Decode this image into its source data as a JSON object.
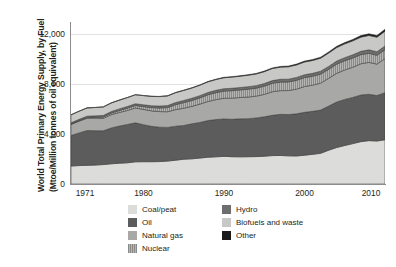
{
  "chart_data": {
    "type": "area",
    "stacked": true,
    "title": "",
    "xlabel": "",
    "ylabel": "World Total Primary Energy Supply, by Fuel (Mtoe/Million tonnes of oil equivalent)",
    "ylabel_line1": "World Total Primary Energy Supply, by Fuel",
    "ylabel_line2": "(Mtoe/Million tonnes of oil equivalent)",
    "xlim": [
      1971,
      2010
    ],
    "ylim": [
      0,
      13000
    ],
    "yticks": [
      0,
      4000,
      8000,
      12000
    ],
    "ytick_labels": [
      "0",
      "4,000",
      "8,000",
      "12,000"
    ],
    "xticks": [
      1971,
      1980,
      1990,
      2000,
      2010
    ],
    "xtick_labels": [
      "1971",
      "1980",
      "1990",
      "2000",
      "2010"
    ],
    "grid": "horizontal",
    "legend_position": "bottom",
    "x": [
      1971,
      1972,
      1973,
      1974,
      1975,
      1976,
      1977,
      1978,
      1979,
      1980,
      1981,
      1982,
      1983,
      1984,
      1985,
      1986,
      1987,
      1988,
      1989,
      1990,
      1991,
      1992,
      1993,
      1994,
      1995,
      1996,
      1997,
      1998,
      1999,
      2000,
      2001,
      2002,
      2003,
      2004,
      2005,
      2006,
      2007,
      2008,
      2009,
      2010
    ],
    "series": [
      {
        "name": "Coal/peat",
        "color": "#dcdcda",
        "values": [
          1440,
          1480,
          1500,
          1520,
          1560,
          1620,
          1670,
          1700,
          1780,
          1790,
          1790,
          1800,
          1840,
          1910,
          1990,
          2020,
          2080,
          2150,
          2180,
          2220,
          2190,
          2180,
          2190,
          2200,
          2230,
          2280,
          2290,
          2260,
          2250,
          2310,
          2380,
          2460,
          2710,
          2930,
          3090,
          3240,
          3400,
          3480,
          3450,
          3550
        ]
      },
      {
        "name": "Oil",
        "color": "#5c5c5c",
        "values": [
          2450,
          2620,
          2790,
          2760,
          2710,
          2880,
          2980,
          3080,
          3130,
          2970,
          2840,
          2760,
          2700,
          2730,
          2710,
          2810,
          2860,
          2940,
          2990,
          3000,
          3000,
          3050,
          3050,
          3100,
          3160,
          3230,
          3300,
          3310,
          3380,
          3440,
          3450,
          3470,
          3540,
          3650,
          3700,
          3710,
          3740,
          3720,
          3650,
          3780
        ]
      },
      {
        "name": "Natural gas",
        "color": "#a8a8a6",
        "values": [
          890,
          940,
          990,
          1000,
          1000,
          1060,
          1090,
          1120,
          1190,
          1230,
          1240,
          1250,
          1260,
          1330,
          1380,
          1400,
          1470,
          1530,
          1600,
          1660,
          1700,
          1710,
          1740,
          1750,
          1800,
          1890,
          1900,
          1930,
          1980,
          2070,
          2100,
          2160,
          2230,
          2300,
          2360,
          2420,
          2510,
          2560,
          2520,
          2730
        ]
      },
      {
        "name": "Nuclear",
        "color": "#9d9d9b",
        "hatch": "vertical",
        "values": [
          29,
          41,
          54,
          71,
          110,
          130,
          160,
          190,
          200,
          220,
          260,
          290,
          330,
          400,
          450,
          470,
          500,
          540,
          560,
          580,
          600,
          610,
          630,
          640,
          660,
          680,
          690,
          690,
          710,
          720,
          720,
          730,
          720,
          740,
          740,
          740,
          730,
          730,
          710,
          720
        ]
      },
      {
        "name": "Hydro",
        "color": "#6e6e6e",
        "values": [
          104,
          107,
          111,
          117,
          122,
          123,
          128,
          135,
          140,
          148,
          150,
          155,
          163,
          170,
          174,
          178,
          180,
          185,
          186,
          187,
          192,
          194,
          199,
          204,
          212,
          217,
          220,
          223,
          227,
          228,
          231,
          232,
          235,
          245,
          250,
          259,
          265,
          276,
          282,
          295
        ]
      },
      {
        "name": "Biofuels and waste",
        "color": "#c8c8c6",
        "values": [
          640,
          650,
          660,
          670,
          680,
          690,
          700,
          710,
          720,
          735,
          750,
          760,
          775,
          790,
          805,
          820,
          835,
          850,
          865,
          880,
          895,
          905,
          920,
          935,
          950,
          965,
          975,
          990,
          1005,
          1020,
          1030,
          1045,
          1070,
          1085,
          1105,
          1120,
          1140,
          1155,
          1170,
          1190
        ]
      },
      {
        "name": "Other",
        "color": "#1a1a1a",
        "values": [
          4,
          5,
          5,
          6,
          7,
          8,
          9,
          10,
          11,
          12,
          14,
          16,
          18,
          20,
          23,
          25,
          28,
          30,
          33,
          36,
          39,
          42,
          45,
          48,
          52,
          56,
          60,
          64,
          68,
          73,
          78,
          83,
          89,
          96,
          104,
          113,
          123,
          133,
          142,
          152
        ]
      }
    ],
    "totals": [
      5557,
      5843,
      6110,
      6144,
      6189,
      6511,
      6737,
      6945,
      7171,
      7105,
      7044,
      7031,
      7086,
      7350,
      7532,
      7723,
      7953,
      8225,
      8414,
      8561,
      8576,
      8691,
      8774,
      8877,
      9064,
      9316,
      9435,
      9467,
      9620,
      9861,
      9989,
      10180,
      10594,
      11031,
      11349,
      11602,
      11908,
      12054,
      11924,
      12417
    ],
    "legend": {
      "left_column": [
        {
          "label": "Coal/peat",
          "color": "#dcdcda",
          "pattern": "solid"
        },
        {
          "label": "Oil",
          "color": "#5c5c5c",
          "pattern": "solid"
        },
        {
          "label": "Natural gas",
          "color": "#a8a8a6",
          "pattern": "solid"
        },
        {
          "label": "Nuclear",
          "color": "#9d9d9b",
          "pattern": "vertical-hatch"
        }
      ],
      "right_column": [
        {
          "label": "Hydro",
          "color": "#6e6e6e",
          "pattern": "solid"
        },
        {
          "label": "Biofuels and waste",
          "color": "#c8c8c6",
          "pattern": "solid"
        },
        {
          "label": "Other",
          "color": "#1a1a1a",
          "pattern": "solid"
        }
      ]
    },
    "colors": {
      "axis": "#8c8c8c",
      "grid": "#e2e2e2",
      "text": "#231f20",
      "background": "#ffffff",
      "series_outline": "#3a3a3a"
    }
  }
}
